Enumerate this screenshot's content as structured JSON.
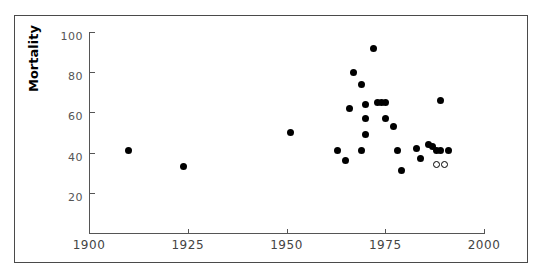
{
  "chart_data": {
    "type": "scatter",
    "title": "",
    "xlabel": "",
    "ylabel": "Mortality",
    "xlim": [
      1900,
      2000
    ],
    "ylim": [
      0,
      100
    ],
    "xticks": [
      1900,
      1925,
      1950,
      1975,
      2000
    ],
    "yticks": [
      20,
      40,
      60,
      80,
      100
    ],
    "xtick_labels": [
      "1900",
      "1925",
      "1950",
      "1975",
      "2000"
    ],
    "ytick_labels": [
      "20",
      "40",
      "60",
      "80",
      "100"
    ],
    "grid": false,
    "legend": "none",
    "series": [
      {
        "name": "filled",
        "marker": "filled-circle",
        "color": "#000000",
        "points": [
          {
            "x": 1910,
            "y": 41
          },
          {
            "x": 1924,
            "y": 33
          },
          {
            "x": 1951,
            "y": 50
          },
          {
            "x": 1963,
            "y": 41
          },
          {
            "x": 1965,
            "y": 36
          },
          {
            "x": 1966,
            "y": 62
          },
          {
            "x": 1967,
            "y": 80
          },
          {
            "x": 1969,
            "y": 74
          },
          {
            "x": 1969,
            "y": 41
          },
          {
            "x": 1970,
            "y": 64
          },
          {
            "x": 1970,
            "y": 57
          },
          {
            "x": 1970,
            "y": 49
          },
          {
            "x": 1972,
            "y": 92
          },
          {
            "x": 1973,
            "y": 65
          },
          {
            "x": 1974,
            "y": 65
          },
          {
            "x": 1975,
            "y": 65
          },
          {
            "x": 1975,
            "y": 57
          },
          {
            "x": 1977,
            "y": 53
          },
          {
            "x": 1978,
            "y": 41
          },
          {
            "x": 1979,
            "y": 31
          },
          {
            "x": 1983,
            "y": 42
          },
          {
            "x": 1984,
            "y": 37
          },
          {
            "x": 1986,
            "y": 44
          },
          {
            "x": 1987,
            "y": 43
          },
          {
            "x": 1988,
            "y": 41
          },
          {
            "x": 1989,
            "y": 41
          },
          {
            "x": 1989,
            "y": 66
          },
          {
            "x": 1991,
            "y": 41
          }
        ]
      },
      {
        "name": "open",
        "marker": "open-circle",
        "color": "#000000",
        "points": [
          {
            "x": 1988,
            "y": 34
          },
          {
            "x": 1990,
            "y": 34
          }
        ]
      }
    ]
  },
  "axes": {
    "y_axis_title": "Mortality"
  }
}
